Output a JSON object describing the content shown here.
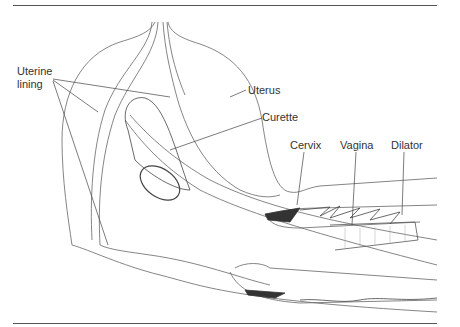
{
  "diagram": {
    "labels": {
      "uterine_lining_1": "Uterine",
      "uterine_lining_2": "lining",
      "uterus": "Uterus",
      "curette": "Curette",
      "cervix": "Cervix",
      "vagina": "Vagina",
      "dilator": "Dilator"
    },
    "colors": {
      "line": "#555555",
      "text": "#333333",
      "background": "#ffffff"
    }
  }
}
